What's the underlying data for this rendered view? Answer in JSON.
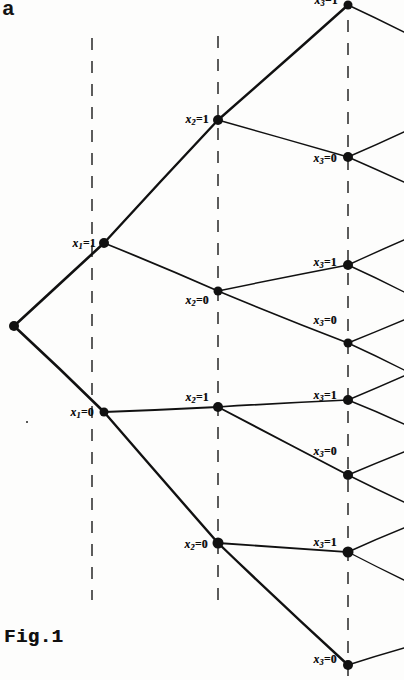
{
  "figure": {
    "caption": "Fig.1",
    "corner_mark": "a",
    "type": "binary-decision-tree",
    "ink_color": "#111111",
    "background_color": "#fdfdfc",
    "width": 404,
    "height": 680
  },
  "levels": [
    {
      "id": "level-1",
      "variable": "x1",
      "guide_x": 92
    },
    {
      "id": "level-2",
      "variable": "x2",
      "guide_x": 218
    },
    {
      "id": "level-3",
      "variable": "x3",
      "guide_x": 348
    }
  ],
  "guides": [
    {
      "id": "guide-x1",
      "x": 92,
      "y1": 38,
      "y2": 600
    },
    {
      "id": "guide-x2",
      "x": 218,
      "y1": 36,
      "y2": 600
    },
    {
      "id": "guide-x3",
      "x": 348,
      "y1": 20,
      "y2": 676
    }
  ],
  "nodes": [
    {
      "id": "root",
      "x": 14,
      "y": 326,
      "label": "",
      "var": "",
      "value": "",
      "r": 5.0
    },
    {
      "id": "n-x1-1",
      "x": 104,
      "y": 243,
      "label": "x1=1",
      "var": "x1",
      "value": "1",
      "r": 5.0,
      "label_dx": -8,
      "label_dy": 1
    },
    {
      "id": "n-x1-0",
      "x": 104,
      "y": 412,
      "label": "x1=0",
      "var": "x1",
      "value": "0",
      "r": 4.5,
      "label_dx": -10,
      "label_dy": 1
    },
    {
      "id": "n-x2-11",
      "x": 218,
      "y": 120,
      "label": "x2=1",
      "var": "x2",
      "value": "1",
      "r": 5.0,
      "label_dx": -9,
      "label_dy": 0
    },
    {
      "id": "n-x2-10",
      "x": 218,
      "y": 291,
      "label": "x2=0",
      "var": "x2",
      "value": "0",
      "r": 4.5,
      "label_dx": -9,
      "label_dy": 10
    },
    {
      "id": "n-x2-01",
      "x": 218,
      "y": 407,
      "label": "x2=1",
      "var": "x2",
      "value": "1",
      "r": 5.0,
      "label_dx": -9,
      "label_dy": -9
    },
    {
      "id": "n-x2-00",
      "x": 218,
      "y": 543,
      "label": "x2=0",
      "var": "x2",
      "value": "0",
      "r": 5.5,
      "label_dx": -10,
      "label_dy": 2
    },
    {
      "id": "n-x3-111",
      "x": 348,
      "y": 5,
      "label": "x3=1",
      "var": "x3",
      "value": "1",
      "r": 4.5,
      "label_dx": -10,
      "label_dy": -4
    },
    {
      "id": "n-x3-110",
      "x": 348,
      "y": 157,
      "label": "x3=0",
      "var": "x3",
      "value": "0",
      "r": 5.0,
      "label_dx": -11,
      "label_dy": 2
    },
    {
      "id": "n-x3-101",
      "x": 348,
      "y": 265,
      "label": "x3=1",
      "var": "x3",
      "value": "1",
      "r": 5.0,
      "label_dx": -11,
      "label_dy": -2
    },
    {
      "id": "n-x3-100",
      "x": 348,
      "y": 343,
      "label": "x3=0",
      "var": "x3",
      "value": "0",
      "r": 4.5,
      "label_dx": -11,
      "label_dy": -22
    },
    {
      "id": "n-x3-011",
      "x": 348,
      "y": 400,
      "label": "x3=1",
      "var": "x3",
      "value": "1",
      "r": 5.0,
      "label_dx": -11,
      "label_dy": -4
    },
    {
      "id": "n-x3-010",
      "x": 348,
      "y": 475,
      "label": "x3=0",
      "var": "x3",
      "value": "0",
      "r": 5.0,
      "label_dx": -11,
      "label_dy": -23
    },
    {
      "id": "n-x3-001",
      "x": 348,
      "y": 552,
      "label": "x3=1",
      "var": "x3",
      "value": "1",
      "r": 5.5,
      "label_dx": -11,
      "label_dy": -9
    },
    {
      "id": "n-x3-000",
      "x": 348,
      "y": 665,
      "label": "x3=0",
      "var": "x3",
      "value": "0",
      "r": 5.0,
      "label_dx": -11,
      "label_dy": -5
    }
  ],
  "edges": [
    {
      "id": "e-root-x1-1",
      "from": "root",
      "to": "n-x1-1",
      "w": 2.6
    },
    {
      "id": "e-root-x1-0",
      "from": "root",
      "to": "n-x1-0",
      "w": 2.6
    },
    {
      "id": "e-x1-1-x2-11",
      "from": "n-x1-1",
      "to": "n-x2-11",
      "w": 2.4
    },
    {
      "id": "e-x1-1-x2-10",
      "from": "n-x1-1",
      "to": "n-x2-10",
      "w": 1.8
    },
    {
      "id": "e-x1-0-x2-01",
      "from": "n-x1-0",
      "to": "n-x2-01",
      "w": 2.2
    },
    {
      "id": "e-x1-0-x2-00",
      "from": "n-x1-0",
      "to": "n-x2-00",
      "w": 2.4
    },
    {
      "id": "e-x2-11-x3-111",
      "from": "n-x2-11",
      "to": "n-x3-111",
      "w": 2.4
    },
    {
      "id": "e-x2-11-x3-110",
      "from": "n-x2-11",
      "to": "n-x3-110",
      "w": 1.5
    },
    {
      "id": "e-x2-10-x3-101",
      "from": "n-x2-10",
      "to": "n-x3-101",
      "w": 1.5
    },
    {
      "id": "e-x2-10-x3-100",
      "from": "n-x2-10",
      "to": "n-x3-100",
      "w": 1.6
    },
    {
      "id": "e-x2-01-x3-011",
      "from": "n-x2-01",
      "to": "n-x3-011",
      "w": 1.7
    },
    {
      "id": "e-x2-01-x3-010",
      "from": "n-x2-01",
      "to": "n-x3-010",
      "w": 1.9
    },
    {
      "id": "e-x2-00-x3-001",
      "from": "n-x2-00",
      "to": "n-x3-001",
      "w": 1.8
    },
    {
      "id": "e-x2-00-x3-000",
      "from": "n-x2-00",
      "to": "n-x3-000",
      "w": 2.4
    }
  ],
  "leaf_stubs": [
    {
      "id": "stub-111-a",
      "from": "n-x3-111",
      "x2": 404,
      "y2": 32,
      "w": 1.4
    },
    {
      "id": "stub-110-a",
      "from": "n-x3-110",
      "x2": 404,
      "y2": 132,
      "w": 1.4
    },
    {
      "id": "stub-110-b",
      "from": "n-x3-110",
      "x2": 404,
      "y2": 182,
      "w": 1.4
    },
    {
      "id": "stub-101-a",
      "from": "n-x3-101",
      "x2": 404,
      "y2": 240,
      "w": 1.4
    },
    {
      "id": "stub-101-b",
      "from": "n-x3-101",
      "x2": 404,
      "y2": 292,
      "w": 1.4
    },
    {
      "id": "stub-100-a",
      "from": "n-x3-100",
      "x2": 404,
      "y2": 320,
      "w": 1.4
    },
    {
      "id": "stub-100-b",
      "from": "n-x3-100",
      "x2": 404,
      "y2": 370,
      "w": 1.4
    },
    {
      "id": "stub-011-a",
      "from": "n-x3-011",
      "x2": 404,
      "y2": 376,
      "w": 1.4
    },
    {
      "id": "stub-011-b",
      "from": "n-x3-011",
      "x2": 404,
      "y2": 424,
      "w": 1.4
    },
    {
      "id": "stub-010-a",
      "from": "n-x3-010",
      "x2": 404,
      "y2": 452,
      "w": 1.4
    },
    {
      "id": "stub-010-b",
      "from": "n-x3-010",
      "x2": 404,
      "y2": 502,
      "w": 1.4
    },
    {
      "id": "stub-001-a",
      "from": "n-x3-001",
      "x2": 404,
      "y2": 528,
      "w": 1.4
    },
    {
      "id": "stub-001-b",
      "from": "n-x3-001",
      "x2": 404,
      "y2": 580,
      "w": 1.4
    },
    {
      "id": "stub-000-a",
      "from": "n-x3-000",
      "x2": 404,
      "y2": 648,
      "w": 1.4
    }
  ]
}
